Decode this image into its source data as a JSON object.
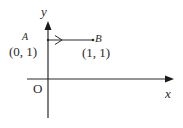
{
  "diagram": {
    "type": "coordinate-plane",
    "axes": {
      "x_label": "x",
      "y_label": "y",
      "origin_label": "O"
    },
    "points": [
      {
        "name": "A",
        "coords_label": "(0, 1)",
        "x": 0,
        "y": 1
      },
      {
        "name": "B",
        "coords_label": "(1, 1)",
        "x": 1,
        "y": 1
      }
    ],
    "segment": {
      "from": "A",
      "to": "B",
      "direction_arrow": "A-to-B"
    },
    "colors": {
      "ink": "#2a2a2a",
      "background": "#ffffff"
    }
  }
}
